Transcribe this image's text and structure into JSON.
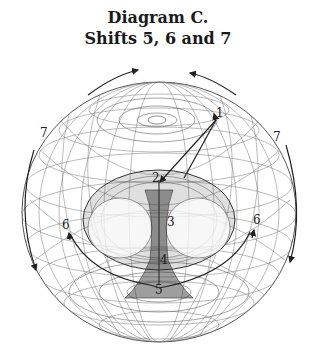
{
  "title": {
    "line1": "Diagram C.",
    "line2": "Shifts 5, 6 and 7"
  },
  "labels": {
    "l1": "1",
    "l2": "2",
    "l3": "3",
    "l4": "4",
    "l5": "5",
    "l6_left": "6",
    "l6_right": "6",
    "l7_left": "7",
    "l7_right": "7"
  },
  "colors": {
    "ink": "#222222",
    "mesh": "#6a6a6a",
    "background": "#ffffff"
  }
}
